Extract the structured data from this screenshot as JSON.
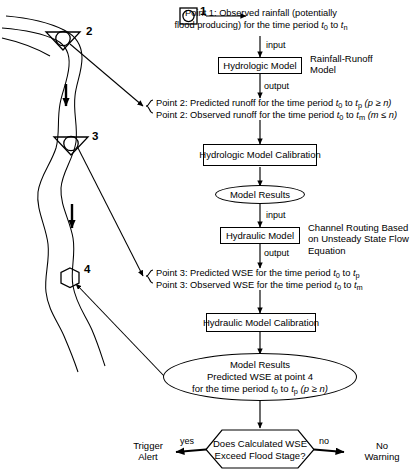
{
  "diagram": {
    "map": {
      "points": [
        {
          "id": "1",
          "label": "1",
          "marker": "circle-in-square-icon",
          "meaning": "rain gage"
        },
        {
          "id": "2",
          "label": "2",
          "marker": "circle-in-triangle-icon",
          "meaning": "stream gage"
        },
        {
          "id": "3",
          "label": "3",
          "marker": "circle-in-triangle-icon",
          "meaning": "stream gage"
        },
        {
          "id": "4",
          "label": "4",
          "marker": "hexagon-icon",
          "meaning": "forecast point"
        }
      ],
      "flow_arrows": 2
    },
    "nodes": {
      "point1_text_line1": "Point 1: Observed rainfall (potentially",
      "point1_text_line2_a": "flood producing) for the time period ",
      "point1_text_line2_t0": "t",
      "point1_text_line2_t0sub": "0",
      "point1_text_line2_to": " to ",
      "point1_text_line2_tn": "t",
      "point1_text_line2_tnsub": "n",
      "hydrologic_model": "Hydrologic Model",
      "rainfall_runoff_label_line1": "Rainfall-Runoff",
      "rainfall_runoff_label_line2": "Model",
      "point2_pred_prefix": "Point 2: Predicted runoff for the time period ",
      "point2_pred_t0": "t",
      "point2_pred_t0sub": "0",
      "point2_pred_to": " to ",
      "point2_pred_tp": "t",
      "point2_pred_tpsub": "p",
      "point2_pred_cond": " (p ≥ n)",
      "point2_obs_prefix": "Point 2: Observed runoff for the time period ",
      "point2_obs_t0": "t",
      "point2_obs_t0sub": "0",
      "point2_obs_to": " to ",
      "point2_obs_tm": "t",
      "point2_obs_tmsub": "m",
      "point2_obs_cond": " (m ≤ n)",
      "hydrologic_calibration": "Hydrologic Model Calibration",
      "model_results_1": "Model Results",
      "hydraulic_model": "Hydraulic Model",
      "channel_routing_line1": "Channel Routing Based",
      "channel_routing_line2": "on Unsteady State Flow",
      "channel_routing_line3": "Equation",
      "point3_pred_prefix": "Point 3: Predicted WSE for the time period ",
      "point3_pred_t0": "t",
      "point3_pred_t0sub": "0",
      "point3_pred_to": " to ",
      "point3_pred_tp": "t",
      "point3_pred_tpsub": "p",
      "point3_obs_prefix": "Point 3: Observed WSE for the time period ",
      "point3_obs_t0": "t",
      "point3_obs_t0sub": "0",
      "point3_obs_to": " to ",
      "point3_obs_tm": "t",
      "point3_obs_tmsub": "m",
      "hydraulic_calibration": "Hydraulic Model Calibration",
      "model_results_2_line1": "Model Results",
      "model_results_2_line2": "Predicted WSE at point 4",
      "model_results_2_line3_a": "for the time period ",
      "model_results_2_t0": "t",
      "model_results_2_t0sub": "0",
      "model_results_2_to": " to ",
      "model_results_2_tp": "t",
      "model_results_2_tpsub": "p",
      "model_results_2_cond": " (p ≥ n)",
      "decision_line1": "Does Calculated WSE",
      "decision_line2": "Exceed Flood Stage?",
      "trigger_alert_line1": "Trigger",
      "trigger_alert_line2": "Alert",
      "no_warning_line1": "No",
      "no_warning_line2": "Warning"
    },
    "edge_labels": {
      "input_1": "input",
      "output_1": "output",
      "input_2": "input",
      "output_2": "output",
      "yes": "yes",
      "no": "no"
    },
    "colors": {
      "stroke": "#000000",
      "background": "#ffffff"
    }
  }
}
